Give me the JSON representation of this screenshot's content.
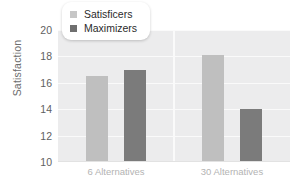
{
  "chart_data": {
    "type": "bar",
    "title": "",
    "xlabel": "",
    "ylabel": "Satisfaction",
    "categories": [
      "6 Alternatives",
      "30 Alternatives"
    ],
    "series": [
      {
        "name": "Satisficers",
        "color": "#bfbfbf",
        "values": [
          16.5,
          18.1
        ]
      },
      {
        "name": "Maximizers",
        "color": "#7b7b7b",
        "values": [
          17.0,
          14.0
        ]
      }
    ],
    "ylim": [
      10,
      20
    ],
    "yticks": [
      10,
      12,
      14,
      16,
      18,
      20
    ],
    "ytick_labels": [
      "10",
      "12",
      "14",
      "16",
      "18",
      "20"
    ],
    "grid": true,
    "legend_position": "top-left",
    "plot_background": "#ececed",
    "gridline_color": "#fafafa"
  },
  "legend": {
    "items": [
      {
        "label": "Satisficers",
        "swatch": "legend-swatch-satisficers"
      },
      {
        "label": "Maximizers",
        "swatch": "legend-swatch-maximizers"
      }
    ]
  }
}
